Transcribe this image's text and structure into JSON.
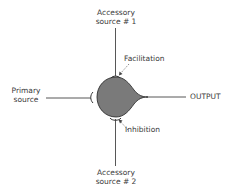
{
  "diagram": {
    "nodes": {
      "accessory1": {
        "line1": "Accessory",
        "line2": "source # 1"
      },
      "accessory2": {
        "line1": "Accessory",
        "line2": "source # 2"
      },
      "primary": {
        "line1": "Primary",
        "line2": "source"
      },
      "output": {
        "label": "OUTPUT"
      }
    },
    "annotations": {
      "facilitation": "Facilitation",
      "inhibition": "Inhibition"
    },
    "colors": {
      "cell_fill": "#7a7a7a",
      "line": "#444444",
      "text": "#3a3a3a"
    }
  }
}
